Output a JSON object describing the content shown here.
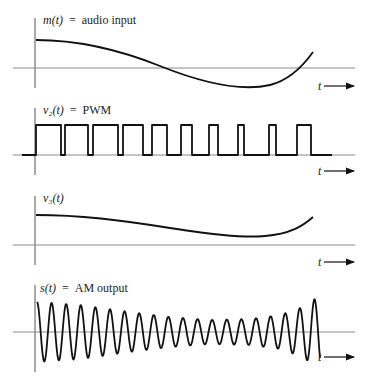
{
  "panels": [
    {
      "id": "m",
      "label_fn": "m(t)",
      "label_eq": "=",
      "label_text": "audio input",
      "t_label": "t"
    },
    {
      "id": "v2",
      "label_fn": "v₂(t)",
      "label_eq": "=",
      "label_text": "PWM",
      "t_label": "t"
    },
    {
      "id": "v3",
      "label_fn": "v₃(t)",
      "label_eq": "",
      "label_text": "",
      "t_label": "t"
    },
    {
      "id": "s",
      "label_fn": "s(t)",
      "label_eq": "=",
      "label_text": "AM output",
      "t_label": "t"
    }
  ],
  "colors": {
    "signal": "#111111",
    "axis": "#8a8a8a"
  }
}
